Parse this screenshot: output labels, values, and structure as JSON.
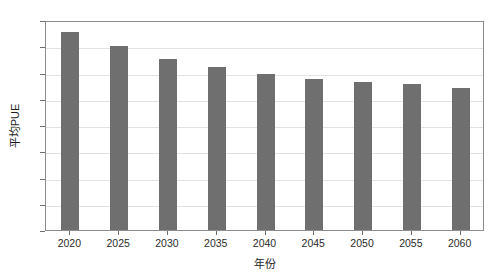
{
  "chart_data": {
    "type": "bar",
    "title": "",
    "subtitle": "",
    "xlabel": "年份",
    "ylabel": "平均PUE",
    "categories": [
      "2020",
      "2025",
      "2030",
      "2035",
      "2040",
      "2045",
      "2050",
      "2055",
      "2060"
    ],
    "values": [
      1.51,
      1.4,
      1.3,
      1.24,
      1.19,
      1.15,
      1.13,
      1.11,
      1.08
    ],
    "series": [
      {
        "name": "平均PUE",
        "values": [
          1.51,
          1.4,
          1.3,
          1.24,
          1.19,
          1.15,
          1.13,
          1.11,
          1.08
        ],
        "color": "#6f6f6f"
      }
    ],
    "ylim": [
      0,
      1.6
    ],
    "yticks": [
      "0",
      "0.2",
      "0.4",
      "0.6",
      "0.8",
      "1.0",
      "1.2",
      "1.4",
      "1.6"
    ],
    "ytick_values": [
      0,
      0.2,
      0.4,
      0.6,
      0.8,
      1.0,
      1.2,
      1.4,
      1.6
    ],
    "xticks": [
      "2020",
      "2025",
      "2030",
      "2035",
      "2040",
      "2045",
      "2050",
      "2055",
      "2060"
    ],
    "grid": true,
    "grid_axis": "y",
    "legend": false,
    "legend_position": "none",
    "bar_color": "#6f6f6f",
    "frame_color": "#8c8c8c",
    "gridline_color": "#e2e2e2",
    "background": "#ffffff",
    "annotations": []
  }
}
